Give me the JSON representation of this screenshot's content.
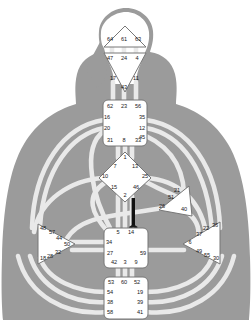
{
  "chart": {
    "type": "diagram",
    "colors": {
      "body_silhouette": "#9a9a9a",
      "center_fill": "#ffffff",
      "center_stroke": "#6e6e6e",
      "channel_light": "#e6e6e6",
      "channel_stroke": "#bdbdbd",
      "activated_channel": "#101010",
      "label_text": "#1a1a1a",
      "background": "#ffffff"
    }
  },
  "centers": {
    "head": {
      "name": "Head Center",
      "shape": "triangle-up",
      "defined": false,
      "gates": [
        "64",
        "61",
        "63"
      ]
    },
    "ajna": {
      "name": "Ajna Center",
      "shape": "triangle-down",
      "defined": false,
      "gates_top": [
        "47",
        "24",
        "4"
      ],
      "gates_bottom": [
        "17",
        "11"
      ],
      "gate_apex": "43"
    },
    "throat": {
      "name": "Throat Center",
      "shape": "square",
      "defined": false,
      "gates_top": [
        "62",
        "23",
        "56"
      ],
      "gates_left": [
        "16",
        "20"
      ],
      "gates_right": [
        "35",
        "12",
        "45"
      ],
      "gates_bottom": [
        "31",
        "8",
        "33"
      ]
    },
    "g": {
      "name": "G Center",
      "shape": "diamond",
      "defined": false,
      "gate_top": "1",
      "gates_upper": [
        "7",
        "13"
      ],
      "gates_mid": [
        "10",
        "25"
      ],
      "gates_lower": [
        "15",
        "46"
      ],
      "gate_bottom": "2"
    },
    "heart": {
      "name": "Heart / Ego Center",
      "shape": "triangle-left",
      "defined": false,
      "gates": [
        "21",
        "51",
        "26",
        "40"
      ]
    },
    "spleen": {
      "name": "Spleen Center",
      "shape": "triangle-right",
      "defined": false,
      "gates": [
        "48",
        "57",
        "44",
        "50",
        "32",
        "28",
        "18"
      ]
    },
    "solar_plexus": {
      "name": "Solar Plexus Center",
      "shape": "triangle-left",
      "defined": false,
      "gates": [
        "22",
        "36",
        "37",
        "6",
        "49",
        "55",
        "30"
      ]
    },
    "sacral": {
      "name": "Sacral Center",
      "shape": "square",
      "defined": false,
      "gates_top": [
        "5",
        "14"
      ],
      "gates_left": [
        "34",
        "27"
      ],
      "gates_right": [
        "59"
      ],
      "gates_bottom": [
        "42",
        "3",
        "9"
      ]
    },
    "root": {
      "name": "Root Center",
      "shape": "square",
      "defined": false,
      "gates_top": [
        "53",
        "60",
        "52"
      ],
      "gates_left": [
        "54",
        "38",
        "58"
      ],
      "gates_right": [
        "19",
        "39",
        "41"
      ]
    }
  },
  "gate_labels": {
    "head": [
      {
        "id": "g64",
        "text": "64",
        "x": 110,
        "y": 40
      },
      {
        "id": "g61",
        "text": "61",
        "x": 124,
        "y": 40
      },
      {
        "id": "g63",
        "text": "63",
        "x": 138,
        "y": 40
      }
    ],
    "ajna": [
      {
        "id": "g47",
        "text": "47",
        "x": 110,
        "y": 59
      },
      {
        "id": "g24",
        "text": "24",
        "x": 124,
        "y": 59
      },
      {
        "id": "g4",
        "text": "4",
        "x": 137,
        "y": 59
      },
      {
        "id": "g17",
        "text": "17",
        "x": 113,
        "y": 79
      },
      {
        "id": "g11",
        "text": "11",
        "x": 136,
        "y": 79
      },
      {
        "id": "g43",
        "text": "43",
        "x": 124,
        "y": 88
      }
    ],
    "throat": [
      {
        "id": "g62",
        "text": "62",
        "x": 110,
        "y": 107
      },
      {
        "id": "g23",
        "text": "23",
        "x": 124,
        "y": 107
      },
      {
        "id": "g56",
        "text": "56",
        "x": 138,
        "y": 107
      },
      {
        "id": "g16",
        "text": "16",
        "x": 107,
        "y": 118
      },
      {
        "id": "g35",
        "text": "35",
        "x": 142,
        "y": 118
      },
      {
        "id": "g20",
        "text": "20",
        "x": 107,
        "y": 129
      },
      {
        "id": "g12",
        "text": "12",
        "x": 142,
        "y": 129
      },
      {
        "id": "g45",
        "text": "45",
        "x": 142,
        "y": 138
      },
      {
        "id": "g31",
        "text": "31",
        "x": 110,
        "y": 141
      },
      {
        "id": "g8",
        "text": "8",
        "x": 124,
        "y": 141
      },
      {
        "id": "g33",
        "text": "33",
        "x": 138,
        "y": 141
      }
    ],
    "g_center": [
      {
        "id": "g1",
        "text": "1",
        "x": 125,
        "y": 158
      },
      {
        "id": "g7",
        "text": "7",
        "x": 115,
        "y": 167
      },
      {
        "id": "g13",
        "text": "13",
        "x": 135,
        "y": 167
      },
      {
        "id": "g10",
        "text": "10",
        "x": 105,
        "y": 177
      },
      {
        "id": "g25",
        "text": "25",
        "x": 145,
        "y": 177
      },
      {
        "id": "g15",
        "text": "15",
        "x": 114,
        "y": 188
      },
      {
        "id": "g46",
        "text": "46",
        "x": 136,
        "y": 188
      },
      {
        "id": "g2",
        "text": "2",
        "x": 125,
        "y": 196
      }
    ],
    "heart": [
      {
        "id": "g21",
        "text": "21",
        "x": 177,
        "y": 191
      },
      {
        "id": "g51",
        "text": "51",
        "x": 171,
        "y": 198
      },
      {
        "id": "g26",
        "text": "26",
        "x": 162,
        "y": 207
      },
      {
        "id": "g40",
        "text": "40",
        "x": 184,
        "y": 210
      }
    ],
    "spleen": [
      {
        "id": "g48",
        "text": "48",
        "x": 43,
        "y": 229
      },
      {
        "id": "g57",
        "text": "57",
        "x": 52,
        "y": 233
      },
      {
        "id": "g44",
        "text": "44",
        "x": 59,
        "y": 239
      },
      {
        "id": "g50",
        "text": "50",
        "x": 67,
        "y": 245
      },
      {
        "id": "g32",
        "text": "32",
        "x": 58,
        "y": 253
      },
      {
        "id": "g28",
        "text": "28",
        "x": 50,
        "y": 257
      },
      {
        "id": "g18",
        "text": "18",
        "x": 43,
        "y": 259
      }
    ],
    "solar_plexus": [
      {
        "id": "g22",
        "text": "22",
        "x": 206,
        "y": 229
      },
      {
        "id": "g36",
        "text": "36",
        "x": 215,
        "y": 226
      },
      {
        "id": "g37",
        "text": "37",
        "x": 199,
        "y": 235
      },
      {
        "id": "g6",
        "text": "6",
        "x": 190,
        "y": 243
      },
      {
        "id": "g49",
        "text": "49",
        "x": 199,
        "y": 252
      },
      {
        "id": "g55",
        "text": "55",
        "x": 207,
        "y": 256
      },
      {
        "id": "g30",
        "text": "30",
        "x": 216,
        "y": 259
      }
    ],
    "sacral": [
      {
        "id": "g5",
        "text": "5",
        "x": 118,
        "y": 233
      },
      {
        "id": "g14",
        "text": "14",
        "x": 131,
        "y": 233
      },
      {
        "id": "g34",
        "text": "34",
        "x": 109,
        "y": 243
      },
      {
        "id": "g59",
        "text": "59",
        "x": 143,
        "y": 254
      },
      {
        "id": "g27",
        "text": "27",
        "x": 110,
        "y": 254
      },
      {
        "id": "g42",
        "text": "42",
        "x": 114,
        "y": 263
      },
      {
        "id": "g3",
        "text": "3",
        "x": 125,
        "y": 263
      },
      {
        "id": "g9",
        "text": "9",
        "x": 136,
        "y": 263
      }
    ],
    "root": [
      {
        "id": "g53",
        "text": "53",
        "x": 111,
        "y": 283
      },
      {
        "id": "g60",
        "text": "60",
        "x": 124,
        "y": 283
      },
      {
        "id": "g52",
        "text": "52",
        "x": 137,
        "y": 283
      },
      {
        "id": "g54",
        "text": "54",
        "x": 110,
        "y": 293
      },
      {
        "id": "g19",
        "text": "19",
        "x": 140,
        "y": 293
      },
      {
        "id": "g38",
        "text": "38",
        "x": 110,
        "y": 303
      },
      {
        "id": "g39",
        "text": "39",
        "x": 140,
        "y": 303
      },
      {
        "id": "g58",
        "text": "58",
        "x": 110,
        "y": 313
      },
      {
        "id": "g41",
        "text": "41",
        "x": 140,
        "y": 313
      }
    ]
  },
  "activations": {
    "defined_channel_note": "14",
    "planet_marker": "node"
  }
}
